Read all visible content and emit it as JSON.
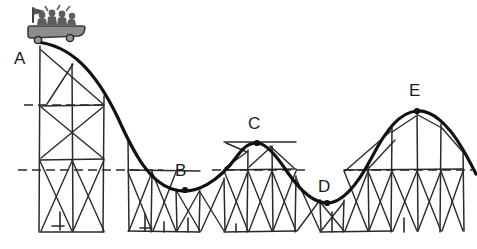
{
  "figure": {
    "background_color": "#ffffff",
    "ink_color": "#1d1d1d",
    "cart_color": "#8a8a8a",
    "width": 477,
    "height": 249
  },
  "labels": {
    "a": "A",
    "b": "B",
    "c": "C",
    "d": "D",
    "e": "E"
  },
  "points": [
    {
      "id": "A",
      "label": "A",
      "label_x": 14,
      "label_y": 50,
      "marker": false,
      "marker_x": 40,
      "marker_y": 42,
      "kind": "start-peak"
    },
    {
      "id": "B",
      "label": "B",
      "label_x": 175,
      "label_y": 162,
      "marker": true,
      "marker_x": 185,
      "marker_y": 190,
      "kind": "valley"
    },
    {
      "id": "C",
      "label": "C",
      "label_x": 248,
      "label_y": 115,
      "marker": true,
      "marker_x": 257,
      "marker_y": 143,
      "kind": "peak"
    },
    {
      "id": "D",
      "label": "D",
      "label_x": 318,
      "label_y": 178,
      "marker": true,
      "marker_x": 327,
      "marker_y": 203,
      "kind": "valley"
    },
    {
      "id": "E",
      "label": "E",
      "label_x": 409,
      "label_y": 82,
      "marker": true,
      "marker_x": 417,
      "marker_y": 111,
      "kind": "peak"
    }
  ],
  "track": {
    "description": "continuous roller coaster rail",
    "path": "M 36 42 C 70 45, 95 70, 118 118 C 135 156, 150 182, 172 189 C 196 197, 220 180, 238 155 C 246 144, 252 143, 257 143 C 266 143, 276 155, 288 173 C 302 193, 314 203, 327 203 C 343 203, 358 184, 372 157 C 386 130, 400 112, 417 111 C 432 110, 448 124, 462 148 C 468 158, 472 166, 476 174"
  },
  "reference_lines": [
    {
      "id": "upper-left-dashed",
      "x1": 24,
      "y1": 105,
      "x2": 108,
      "y2": 105
    },
    {
      "id": "main-dashed-left",
      "x1": 18,
      "y1": 170,
      "x2": 163,
      "y2": 170
    },
    {
      "id": "main-dashed-mid",
      "x1": 212,
      "y1": 170,
      "x2": 305,
      "y2": 170
    },
    {
      "id": "main-dashed-right",
      "x1": 344,
      "y1": 170,
      "x2": 472,
      "y2": 170
    }
  ],
  "ground": {
    "y": 233,
    "x1": 22,
    "x2": 470
  },
  "cart": {
    "name": "roller-coaster-car",
    "x": 28,
    "y": 8,
    "width": 56,
    "height": 34,
    "passengers": 4,
    "flag": true,
    "wheels": 2
  }
}
